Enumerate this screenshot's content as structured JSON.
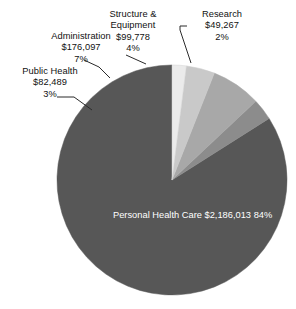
{
  "chart_data": {
    "type": "pie",
    "title": "",
    "subtitle": "",
    "xlabel": "",
    "ylabel": "",
    "legend_position": "none",
    "grid": false,
    "labels_show_value": true,
    "labels_show_percent": true,
    "total_value": 2593644,
    "currency_symbol": "$",
    "start_angle_deg": 0,
    "direction": "counterclockwise",
    "categories": [
      "Personal Health Care",
      "Research",
      "Structure & Equipment",
      "Administration",
      "Public Health"
    ],
    "values": [
      2186013,
      49267,
      99778,
      176097,
      82489
    ],
    "percents": [
      84,
      2,
      4,
      7,
      3
    ],
    "value_labels": [
      "$2,186,013",
      "$49,267",
      "$99,778",
      "$176,097",
      "$82,489"
    ],
    "percent_labels": [
      "84%",
      "2%",
      "4%",
      "7%",
      "3%"
    ],
    "colors": [
      "#575757",
      "#ebebeb",
      "#c9c9c9",
      "#a8a8a8",
      "#8c8c8c"
    ],
    "slices": [
      {
        "name": "personal-health-care",
        "label": "Personal Health Care",
        "label_line1": "Personal Health",
        "label_line2": "Care",
        "value_label": "$2,186,013",
        "percent_label": "84%",
        "value": 2186013,
        "percent": 84,
        "color": "#575757",
        "label_placement": "inside"
      },
      {
        "name": "research",
        "label": "Research",
        "value_label": "$49,267",
        "percent_label": "2%",
        "value": 49267,
        "percent": 2,
        "color": "#ebebeb",
        "label_placement": "outside"
      },
      {
        "name": "structure-and-equipment",
        "label": "Structure & Equipment",
        "label_line1": "Structure &",
        "label_line2": "Equipment",
        "value_label": "$99,778",
        "percent_label": "4%",
        "value": 99778,
        "percent": 4,
        "color": "#c9c9c9",
        "label_placement": "outside"
      },
      {
        "name": "administration",
        "label": "Administration",
        "value_label": "$176,097",
        "percent_label": "7%",
        "value": 176097,
        "percent": 7,
        "color": "#a8a8a8",
        "label_placement": "outside"
      },
      {
        "name": "public-health",
        "label": "Public Health",
        "label_line1": "Public Health",
        "value_label": "$82,489",
        "percent_label": "3%",
        "value": 82489,
        "percent": 3,
        "color": "#8c8c8c",
        "label_placement": "outside"
      }
    ]
  },
  "colors": {
    "background": "#ffffff",
    "text": "#111111",
    "inside_label_text": "#ffffff",
    "leader_line": "#2b2b2b",
    "slice_personal_health_care": "#575757",
    "slice_research": "#ebebeb",
    "slice_structure_equipment": "#c9c9c9",
    "slice_administration": "#a8a8a8",
    "slice_public_health": "#8c8c8c"
  }
}
